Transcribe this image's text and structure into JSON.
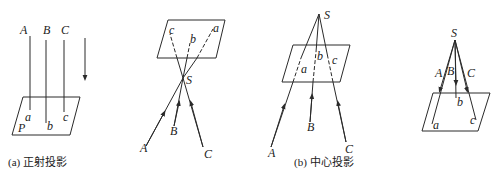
{
  "figure": {
    "panels": [
      {
        "id": "orthographic",
        "caption": "(a)  正射投影",
        "plane_label": "P",
        "points_upper": [
          "A",
          "B",
          "C"
        ],
        "points_lower": [
          "a",
          "b",
          "c"
        ]
      },
      {
        "id": "central-inverted",
        "center_label": "S",
        "points_upper": [
          "A",
          "B",
          "C"
        ],
        "points_lower": [
          "a",
          "b",
          "c"
        ]
      },
      {
        "id": "central-perspective",
        "caption": "(b) 中心投影",
        "center_label": "S",
        "points_upper": [
          "A",
          "B",
          "C"
        ],
        "points_lower": [
          "a",
          "b",
          "c"
        ]
      },
      {
        "id": "central-diverging",
        "center_label": "S",
        "points_upper": [
          "A",
          "B",
          "C"
        ],
        "points_lower": [
          "a",
          "b",
          "c"
        ]
      }
    ]
  }
}
